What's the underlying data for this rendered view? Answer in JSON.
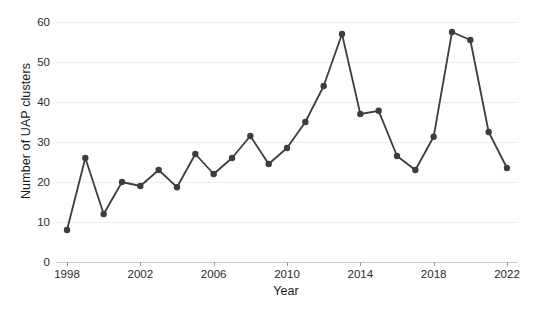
{
  "chart_data": {
    "type": "line",
    "title": "",
    "xlabel": "Year",
    "ylabel": "Number of UAP clusters",
    "x": [
      1998,
      1999,
      2000,
      2001,
      2002,
      2003,
      2004,
      2005,
      2006,
      2007,
      2008,
      2009,
      2010,
      2011,
      2012,
      2013,
      2014,
      2015,
      2016,
      2017,
      2018,
      2019,
      2020,
      2021,
      2022
    ],
    "values": [
      8,
      26,
      12,
      20,
      19,
      23,
      18.7,
      27,
      22,
      26,
      31.5,
      24.5,
      28.5,
      35,
      44,
      57,
      37,
      37.8,
      26.5,
      23,
      31.3,
      57.5,
      55.5,
      32.5,
      23.5
    ],
    "series": [
      {
        "name": "Number of UAP clusters",
        "values": [
          8,
          26,
          12,
          20,
          19,
          23,
          18.7,
          27,
          22,
          26,
          31.5,
          24.5,
          28.5,
          35,
          44,
          57,
          37,
          37.8,
          26.5,
          23,
          31.3,
          57.5,
          55.5,
          32.5,
          23.5
        ]
      }
    ],
    "xlim": [
      1997.4,
      2022.6
    ],
    "ylim": [
      0,
      62
    ],
    "yticks": [
      0,
      10,
      20,
      30,
      40,
      50,
      60
    ],
    "ytick_labels": [
      "0",
      "10",
      "20",
      "30",
      "40",
      "50",
      "60"
    ],
    "xticks": [
      1998,
      2002,
      2006,
      2010,
      2014,
      2018,
      2022
    ],
    "xtick_labels": [
      "1998",
      "2002",
      "2006",
      "2010",
      "2014",
      "2018",
      "2022"
    ],
    "grid": true,
    "grid_axis": "y",
    "legend": false,
    "marker": "circle",
    "line_color": "#3d3d3d",
    "marker_color": "#3d3d3d",
    "grid_color": "#ededee",
    "background_color": "#ffffff"
  }
}
